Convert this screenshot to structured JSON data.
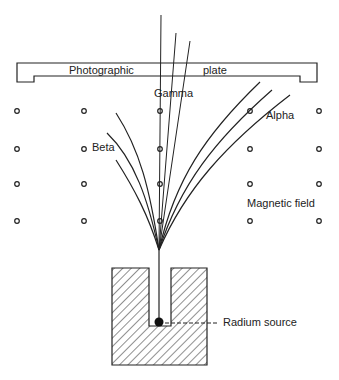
{
  "diagram": {
    "plate_label_left": "Photographic",
    "plate_label_right": "plate",
    "labels": {
      "gamma": "Gamma",
      "alpha": "Alpha",
      "beta": "Beta",
      "magnetic_field": "Magnetic field",
      "radium_source": "Radium source"
    },
    "colors": {
      "ink": "#222222",
      "background": "#ffffff"
    },
    "field_dots": {
      "columns_x": [
        17,
        84,
        160,
        250,
        319
      ],
      "rows_y": [
        111,
        149,
        184,
        221
      ]
    }
  }
}
